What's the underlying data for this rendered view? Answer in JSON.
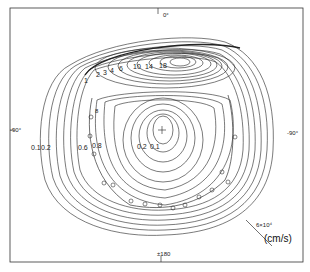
{
  "figure": {
    "type": "contour-map",
    "axis_labels": {
      "top": "0°",
      "bottom": "±180",
      "left": "-90°",
      "right": "-90°"
    },
    "upper_cell_contours": [
      "1",
      "2",
      "3",
      "4",
      "6",
      "10",
      "14",
      "18"
    ],
    "lower_cell_contours_left": [
      "0.1",
      "0.2",
      "0.6",
      "0.8"
    ],
    "lower_cell_contours_inner": [
      "0.2",
      "0.1"
    ],
    "marker_label": "8",
    "scale": {
      "value": "6×10⁴",
      "unit": "(cm/s)"
    },
    "colors": {
      "line": "#222222",
      "background": "#ffffff"
    }
  }
}
